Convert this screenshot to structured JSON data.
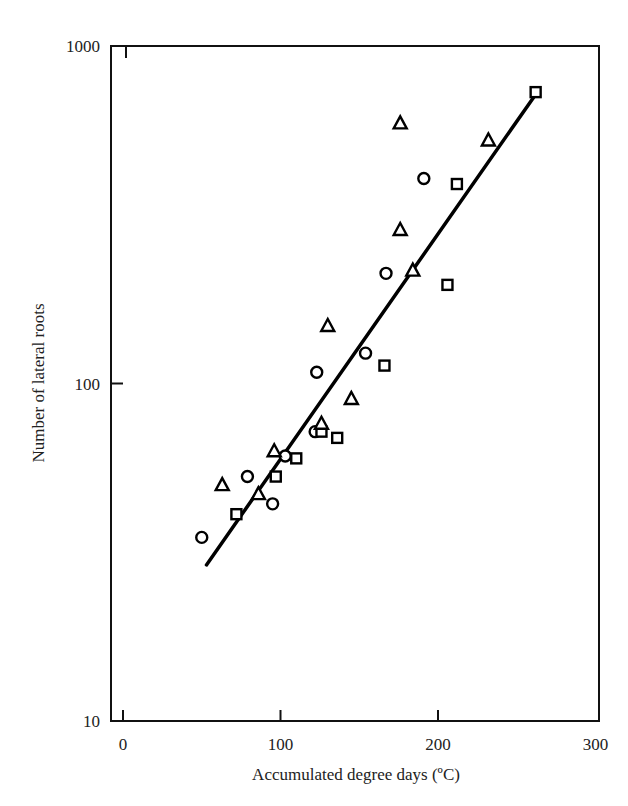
{
  "chart_data": {
    "type": "scatter",
    "title": "",
    "xlabel": "Accumulated degree days (ºC)",
    "ylabel": "Number of lateral roots",
    "xlim": [
      -8,
      300
    ],
    "ylim": [
      10,
      1000
    ],
    "yscale": "log",
    "grid": false,
    "legend": null,
    "x_ticks": [
      0,
      100,
      200,
      300
    ],
    "x_tick_labels": [
      "0",
      "100",
      "200",
      "300"
    ],
    "y_ticks": [
      10,
      100,
      1000
    ],
    "y_tick_labels": [
      "10",
      "100",
      "1000"
    ],
    "series": [
      {
        "name": "circles",
        "marker": "circle",
        "points": [
          [
            50,
            35
          ],
          [
            79,
            53
          ],
          [
            95,
            44
          ],
          [
            103,
            61
          ],
          [
            122,
            72
          ],
          [
            123,
            108
          ],
          [
            154,
            123
          ],
          [
            167,
            212
          ],
          [
            191,
            405
          ]
        ]
      },
      {
        "name": "squares",
        "marker": "square",
        "points": [
          [
            72,
            41
          ],
          [
            97,
            53
          ],
          [
            110,
            60
          ],
          [
            126,
            72
          ],
          [
            136,
            69
          ],
          [
            166,
            113
          ],
          [
            206,
            196
          ],
          [
            212,
            390
          ],
          [
            262,
            730
          ]
        ]
      },
      {
        "name": "triangles",
        "marker": "triangle",
        "points": [
          [
            63,
            50
          ],
          [
            86,
            47
          ],
          [
            96,
            63
          ],
          [
            126,
            76
          ],
          [
            130,
            148
          ],
          [
            145,
            90
          ],
          [
            176,
            590
          ],
          [
            176,
            285
          ],
          [
            184,
            216
          ],
          [
            232,
            525
          ]
        ]
      }
    ],
    "fit_line": {
      "type": "log-linear regression",
      "from": [
        53,
        29
      ],
      "to": [
        263,
        730
      ]
    }
  }
}
